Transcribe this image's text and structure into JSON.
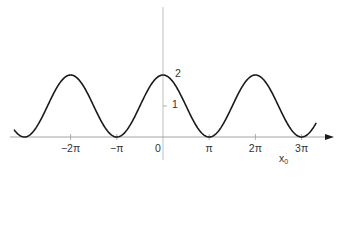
{
  "chart_data": {
    "type": "line",
    "title": "",
    "xlabel": "x0",
    "xlabel_main": "x",
    "xlabel_sub": "0",
    "ylabel": "",
    "function": "1 + cos(x0)",
    "xlim_rad": [
      -8.0,
      4.9
    ],
    "ylim": [
      0,
      2.5
    ],
    "grid": false,
    "legend": null,
    "x_ticks": [
      {
        "value": -6.2832,
        "label": "−2π"
      },
      {
        "value": -3.1416,
        "label": "−π"
      },
      {
        "value": 0,
        "label": "0"
      },
      {
        "value": 3.1416,
        "label": "π"
      },
      {
        "value": 6.2832,
        "label": "2π"
      },
      {
        "value": 9.4248,
        "label": "3π"
      }
    ],
    "y_ticks": [
      {
        "value": 1,
        "label": "1"
      },
      {
        "value": 2,
        "label": "2"
      }
    ],
    "series": [
      {
        "name": "1 + cos(x0)",
        "x": [
          -10.1,
          -9.4248,
          -6.2832,
          -3.1416,
          0,
          3.1416,
          6.2832,
          9.4248,
          10.4
        ],
        "y": [
          0.23,
          0,
          2,
          0,
          2,
          0,
          2,
          0,
          0.5
        ]
      }
    ],
    "colors": {
      "curve": "#1a1a1a",
      "axis": "#9a9a9a",
      "text": "#333333"
    }
  }
}
